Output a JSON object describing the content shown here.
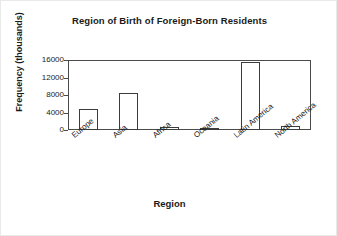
{
  "chart_data": {
    "type": "bar",
    "title": "Region of Birth of Foreign-Born Residents",
    "xlabel": "Region",
    "ylabel": "Frequency (thousands)",
    "categories": [
      "Europe",
      "Asia",
      "Africa",
      "Oceania",
      "Latin America",
      "North America"
    ],
    "values": [
      4800,
      8400,
      800,
      200,
      15600,
      1000
    ],
    "ylim": [
      0,
      16000
    ],
    "yticks": [
      0,
      4000,
      8000,
      12000,
      16000
    ],
    "ytick_labels": [
      "0",
      "4000",
      "8000",
      "12000",
      "16000"
    ],
    "grid": false,
    "legend": "none",
    "bar_fill_color": "#ffffff",
    "bar_edge_color": "#3c3c3c",
    "axis_color": "#4a4a4a",
    "text_color": "#1a1a1a",
    "background_color": "#ffffff"
  }
}
